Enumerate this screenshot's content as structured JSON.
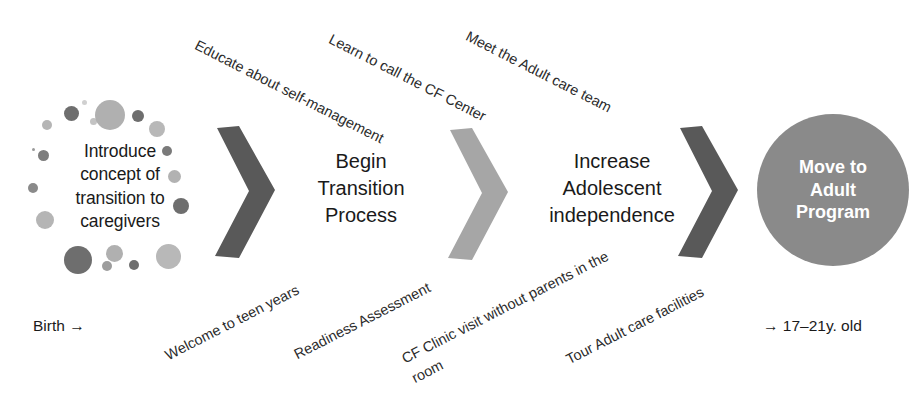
{
  "diagram": {
    "type": "process-flow",
    "background_color": "#ffffff",
    "colors": {
      "chevron_dark": "#595959",
      "chevron_light": "#a6a6a6",
      "circle_fill": "#8a8a8a",
      "circle_text": "#ffffff",
      "body_text": "#1a1a1a",
      "annotation_text": "#2b2b2b",
      "dot_dark": "#6e6e6e",
      "dot_mid": "#8f8f8f",
      "dot_light": "#bcbcbc"
    }
  },
  "stages": [
    {
      "id": "stage-1",
      "shape": "dot-cluster",
      "label": "Introduce concept of transition to caregivers",
      "lines": [
        "Introduce",
        "concept of",
        "transition to",
        "caregivers"
      ]
    },
    {
      "id": "stage-2",
      "shape": "text",
      "label": "Begin Transition Process",
      "lines": [
        "Begin",
        "Transition",
        "Process"
      ]
    },
    {
      "id": "stage-3",
      "shape": "text",
      "label": "Increase Adolescent independence",
      "lines": [
        "Increase",
        "Adolescent",
        "independence"
      ]
    },
    {
      "id": "stage-4",
      "shape": "circle",
      "label": "Move to Adult Program",
      "lines": [
        "Move to",
        "Adult",
        "Program"
      ]
    }
  ],
  "arrows": [
    {
      "id": "arrow-1",
      "icon": "chevron-right-icon",
      "color": "#595959"
    },
    {
      "id": "arrow-2",
      "icon": "chevron-right-icon",
      "color": "#a6a6a6"
    },
    {
      "id": "arrow-3",
      "icon": "chevron-right-icon",
      "color": "#595959"
    }
  ],
  "annotations_top": [
    {
      "id": "annot-top-1",
      "text": "Educate about self-management"
    },
    {
      "id": "annot-top-2",
      "text": "Learn to call the CF Center"
    },
    {
      "id": "annot-top-3",
      "text": "Meet the Adult care team"
    }
  ],
  "annotations_bottom": [
    {
      "id": "annot-bottom-1",
      "text": "Welcome to teen years"
    },
    {
      "id": "annot-bottom-2",
      "text": "Readiness Assessment"
    },
    {
      "id": "annot-bottom-3",
      "text": "CF Clinic visit without parents in the room"
    },
    {
      "id": "annot-bottom-4",
      "text": "Tour Adult care facilities"
    }
  ],
  "endpoints": {
    "start": "Birth →",
    "end": "→ 17–21y. old"
  },
  "dots": [
    {
      "x": 62,
      "y": 20,
      "d": 7,
      "c": "#c3c3c3"
    },
    {
      "x": 36,
      "y": 8,
      "d": 15,
      "c": "#6e6e6e"
    },
    {
      "x": 67,
      "y": 2,
      "d": 30,
      "c": "#b0b0b0"
    },
    {
      "x": 104,
      "y": 12,
      "d": 12,
      "c": "#6e6e6e"
    },
    {
      "x": 14,
      "y": 22,
      "d": 10,
      "c": "#b5b5b5"
    },
    {
      "x": 121,
      "y": 23,
      "d": 16,
      "c": "#b8b8b8"
    },
    {
      "x": 4,
      "y": 50,
      "d": 3,
      "c": "#9a9a9a"
    },
    {
      "x": 10,
      "y": 52,
      "d": 11,
      "c": "#7d7d7d"
    },
    {
      "x": 134,
      "y": 48,
      "d": 10,
      "c": "#7a7a7a"
    },
    {
      "x": 140,
      "y": 72,
      "d": 13,
      "c": "#b2b2b2"
    },
    {
      "x": 0,
      "y": 85,
      "d": 10,
      "c": "#8a8a8a"
    },
    {
      "x": 145,
      "y": 100,
      "d": 16,
      "c": "#6e6e6e"
    },
    {
      "x": 8,
      "y": 113,
      "d": 18,
      "c": "#b5b5b5"
    },
    {
      "x": 36,
      "y": 148,
      "d": 28,
      "c": "#6e6e6e"
    },
    {
      "x": 78,
      "y": 147,
      "d": 17,
      "c": "#b0b0b0"
    },
    {
      "x": 74,
      "y": 163,
      "d": 10,
      "c": "#9d9d9d"
    },
    {
      "x": 101,
      "y": 162,
      "d": 10,
      "c": "#6e6e6e"
    },
    {
      "x": 128,
      "y": 146,
      "d": 25,
      "c": "#b8b8b8"
    },
    {
      "x": 54,
      "y": 2,
      "d": 5,
      "c": "#d0d0d0"
    }
  ]
}
